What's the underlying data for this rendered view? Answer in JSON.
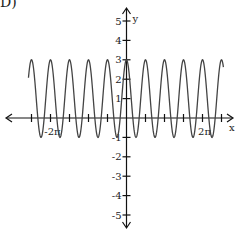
{
  "problem_label": "D)",
  "chart_data": {
    "type": "line",
    "title": "",
    "function": "y = 1 + 2cos(4x)",
    "amplitude": 2,
    "vertical_shift": 1,
    "angular_frequency": 4,
    "xlabel": "x",
    "ylabel": "y",
    "xlim_pi": [
      -2.6,
      2.6
    ],
    "ylim": [
      -5.5,
      5.5
    ],
    "curve_domain_pi": [
      -2.58,
      2.55
    ],
    "x_tick_step_pi": 0.5,
    "x_ticks_pi": [
      -2.5,
      -2,
      -1.5,
      -1,
      -0.5,
      0.5,
      1,
      1.5,
      2,
      2.5
    ],
    "x_tick_labels": [
      {
        "value_pi": -2,
        "text": "-2π"
      },
      {
        "value_pi": 2,
        "text": "2π"
      }
    ],
    "y_ticks": [
      -5,
      -4,
      -3,
      -2,
      -1,
      1,
      2,
      3,
      4,
      5
    ],
    "y_tick_labels": [
      "-5",
      "-4",
      "-3",
      "-2",
      "-1",
      "1",
      "2",
      "3",
      "4",
      "5"
    ],
    "y_max": 3,
    "y_min": -1,
    "grid": false,
    "legend": "none"
  }
}
